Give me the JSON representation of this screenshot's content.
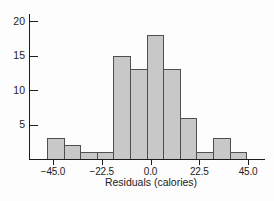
{
  "colors": {
    "background": "#fdfdfd",
    "bar_fill": "#c8c8c8",
    "bar_border": "#4f4f4f",
    "axis": "#1c1c1c",
    "text": "#1c1c1c"
  },
  "chart_data": {
    "type": "bar",
    "subtype": "histogram",
    "title": "",
    "xlabel": "Residuals (calories)",
    "ylabel": "",
    "bins": {
      "start": -47.5,
      "width": 7.5,
      "count": 12
    },
    "values": [
      3,
      2,
      1,
      1,
      15,
      13,
      18,
      13,
      6,
      1,
      3,
      1
    ],
    "x_ticks": {
      "values": [
        -45,
        -22.5,
        0,
        22.5,
        45
      ],
      "labels": [
        "−45.0",
        "−22.5",
        "0.0",
        "22.5",
        "45.0"
      ]
    },
    "y_ticks": {
      "values": [
        5,
        10,
        15,
        20
      ],
      "labels": [
        "5",
        "10",
        "15",
        "20"
      ]
    },
    "xlim": [
      -56,
      53
    ],
    "ylim": [
      0,
      21
    ],
    "grid": false,
    "legend": null
  }
}
